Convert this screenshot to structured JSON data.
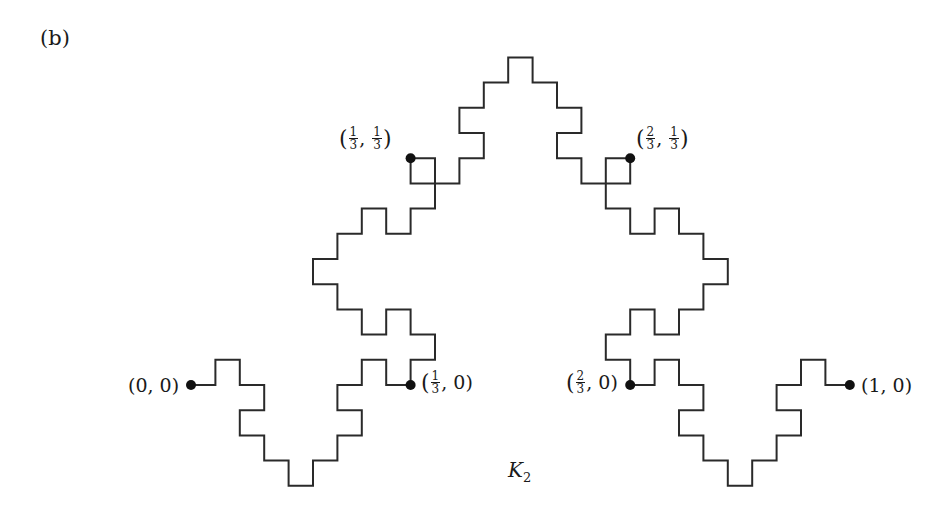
{
  "panel_label": "(b)",
  "curve_label": {
    "name": "K",
    "subscript": "2"
  },
  "style": {
    "stroke": "#2a2a2a",
    "stroke_width": 2,
    "dot_color": "#111111",
    "dot_radius": 5
  },
  "grid": {
    "origin_px": [
      191,
      385
    ],
    "unit_x_px": 24.4,
    "unit_y_px": 25.2,
    "units_per_side": 27
  },
  "points": [
    {
      "id": "p00",
      "coord": [
        0,
        0
      ],
      "label": "(0, 0)"
    },
    {
      "id": "p13_0",
      "coord": [
        9,
        0
      ],
      "label": {
        "open": "(",
        "num": "1",
        "den": "3",
        "rest": ", 0)"
      }
    },
    {
      "id": "p13_13",
      "coord": [
        9,
        9
      ],
      "label": {
        "open": "(",
        "num1": "1",
        "den1": "3",
        "num2": "1",
        "den2": "3",
        "close": ")"
      }
    },
    {
      "id": "p23_13",
      "coord": [
        18,
        9
      ],
      "label": {
        "open": "(",
        "num1": "2",
        "den1": "3",
        "num2": "1",
        "den2": "3",
        "close": ")"
      }
    },
    {
      "id": "p23_0",
      "coord": [
        18,
        0
      ],
      "label": {
        "open": "(",
        "num": "2",
        "den": "3",
        "rest": ", 0)"
      }
    },
    {
      "id": "p10",
      "coord": [
        27,
        0
      ],
      "label": "(1, 0)"
    }
  ],
  "path_grid": [
    [
      0,
      0
    ],
    [
      1,
      0
    ],
    [
      1,
      1
    ],
    [
      2,
      1
    ],
    [
      2,
      0
    ],
    [
      3,
      0
    ],
    [
      3,
      -1
    ],
    [
      2,
      -1
    ],
    [
      2,
      -2
    ],
    [
      3,
      -2
    ],
    [
      3,
      -3
    ],
    [
      4,
      -3
    ],
    [
      4,
      -4
    ],
    [
      5,
      -4
    ],
    [
      5,
      -3
    ],
    [
      6,
      -3
    ],
    [
      6,
      -2
    ],
    [
      7,
      -2
    ],
    [
      7,
      -1
    ],
    [
      6,
      -1
    ],
    [
      6,
      0
    ],
    [
      7,
      0
    ],
    [
      7,
      1
    ],
    [
      8,
      1
    ],
    [
      8,
      0
    ],
    [
      9,
      0
    ],
    [
      9,
      1
    ],
    [
      10,
      1
    ],
    [
      10,
      2
    ],
    [
      9,
      2
    ],
    [
      9,
      3
    ],
    [
      8,
      3
    ],
    [
      8,
      2
    ],
    [
      7,
      2
    ],
    [
      7,
      3
    ],
    [
      6,
      3
    ],
    [
      6,
      4
    ],
    [
      5,
      4
    ],
    [
      5,
      5
    ],
    [
      6,
      5
    ],
    [
      6,
      6
    ],
    [
      7,
      6
    ],
    [
      7,
      7
    ],
    [
      8,
      7
    ],
    [
      8,
      6
    ],
    [
      9,
      6
    ],
    [
      9,
      7
    ],
    [
      10,
      7
    ],
    [
      10,
      9
    ],
    [
      9,
      9
    ],
    [
      9,
      8
    ],
    [
      11,
      8
    ],
    [
      11,
      9
    ],
    [
      12,
      9
    ],
    [
      12,
      10
    ],
    [
      11,
      10
    ],
    [
      11,
      11
    ],
    [
      12,
      11
    ],
    [
      12,
      12
    ],
    [
      13,
      12
    ],
    [
      13,
      13
    ],
    [
      14,
      13
    ],
    [
      14,
      12
    ],
    [
      15,
      12
    ],
    [
      15,
      11
    ],
    [
      16,
      11
    ],
    [
      16,
      10
    ],
    [
      15,
      10
    ],
    [
      15,
      9
    ],
    [
      16,
      9
    ],
    [
      16,
      8
    ],
    [
      18,
      8
    ],
    [
      18,
      9
    ],
    [
      17,
      9
    ],
    [
      17,
      7
    ],
    [
      18,
      7
    ],
    [
      18,
      6
    ],
    [
      19,
      6
    ],
    [
      19,
      7
    ],
    [
      20,
      7
    ],
    [
      20,
      6
    ],
    [
      21,
      6
    ],
    [
      21,
      5
    ],
    [
      22,
      5
    ],
    [
      22,
      4
    ],
    [
      21,
      4
    ],
    [
      21,
      3
    ],
    [
      20,
      3
    ],
    [
      20,
      2
    ],
    [
      19,
      2
    ],
    [
      19,
      3
    ],
    [
      18,
      3
    ],
    [
      18,
      2
    ],
    [
      17,
      2
    ],
    [
      17,
      1
    ],
    [
      18,
      1
    ],
    [
      18,
      0
    ],
    [
      19,
      0
    ],
    [
      19,
      1
    ],
    [
      20,
      1
    ],
    [
      20,
      0
    ],
    [
      21,
      0
    ],
    [
      21,
      -1
    ],
    [
      20,
      -1
    ],
    [
      20,
      -2
    ],
    [
      21,
      -2
    ],
    [
      21,
      -3
    ],
    [
      22,
      -3
    ],
    [
      22,
      -4
    ],
    [
      23,
      -4
    ],
    [
      23,
      -3
    ],
    [
      24,
      -3
    ],
    [
      24,
      -2
    ],
    [
      25,
      -2
    ],
    [
      25,
      -1
    ],
    [
      24,
      -1
    ],
    [
      24,
      0
    ],
    [
      25,
      0
    ],
    [
      25,
      1
    ],
    [
      26,
      1
    ],
    [
      26,
      0
    ],
    [
      27,
      0
    ]
  ]
}
